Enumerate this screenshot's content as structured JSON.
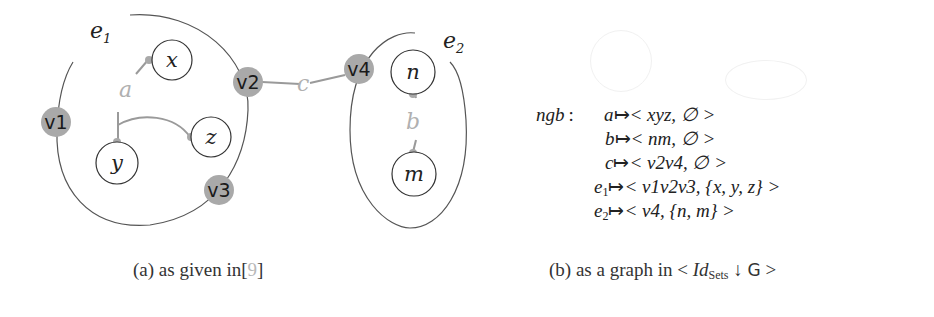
{
  "figure_a": {
    "hyperedges": [
      {
        "id": "e1",
        "label": "e",
        "sub": "1"
      },
      {
        "id": "e2",
        "label": "e",
        "sub": "2"
      }
    ],
    "ports": [
      "v1",
      "v2",
      "v3",
      "v4"
    ],
    "nodes": [
      "x",
      "y",
      "z",
      "n",
      "m"
    ],
    "edges": [
      {
        "label": "a",
        "connects": [
          "x",
          "y",
          "z"
        ]
      },
      {
        "label": "b",
        "connects": [
          "n",
          "m"
        ]
      },
      {
        "label": "c",
        "connects": [
          "v2",
          "v4"
        ]
      }
    ],
    "colors": {
      "port_fill": "#a9a9a9",
      "edge_line": "#9a9a9a",
      "edge_label": "#b0b0b0",
      "outline": "#555555"
    },
    "caption": {
      "prefix": "(a) as given in",
      "ref_open": "[",
      "ref": "9",
      "ref_close": "]"
    }
  },
  "figure_b": {
    "mapping_name": "ngb",
    "separator": ":",
    "rows": [
      {
        "key": "a",
        "key_sub": "",
        "value": "< xyz, ∅ >"
      },
      {
        "key": "b",
        "key_sub": "",
        "value": "< nm, ∅ >"
      },
      {
        "key": "c",
        "key_sub": "",
        "value": "< v2v4, ∅ >"
      },
      {
        "key": "e",
        "key_sub": "1",
        "value": "< v1v2v3, {x, y, z} >"
      },
      {
        "key": "e",
        "key_sub": "2",
        "value": "< v4, {n, m} >"
      }
    ],
    "arrow": "↦",
    "caption": {
      "prefix": "(b) as a graph in <",
      "id": "Id",
      "id_sub": "Sets",
      "arrow": "↓",
      "G": "G",
      "suffix": ">"
    }
  }
}
